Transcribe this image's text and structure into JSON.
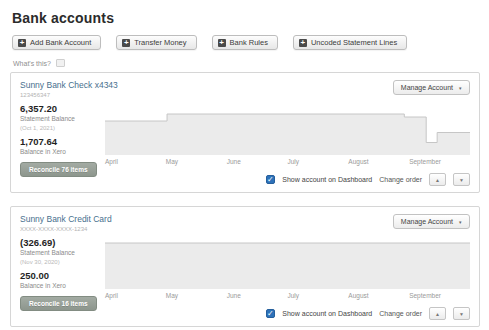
{
  "page": {
    "title": "Bank accounts",
    "whats_this_label": "What's this?"
  },
  "glyphs": {
    "plus": "+",
    "caret_down": "▾",
    "check": "✓",
    "up": "▲",
    "down": "▼"
  },
  "toolbar": {
    "buttons": [
      {
        "label": "Add Bank Account"
      },
      {
        "label": "Transfer Money"
      },
      {
        "label": "Bank Rules"
      },
      {
        "label": "Uncoded Statement Lines"
      }
    ]
  },
  "footer_controls": {
    "show_on_dashboard_label": "Show account on Dashboard",
    "change_order_label": "Change order"
  },
  "accounts": [
    {
      "name": "Sunny Bank Check x4343",
      "number": "123456347",
      "statement_balance": "6,357.20",
      "statement_balance_label": "Statement Balance",
      "statement_date": "(Oct 1, 2021)",
      "xero_balance": "1,707.64",
      "xero_balance_label": "Balance in Xero",
      "reconcile_label": "Reconcile 76 items",
      "manage_label": "Manage Account",
      "months": [
        "April",
        "May",
        "June",
        "July",
        "August",
        "September"
      ],
      "show_on_dashboard_checked": true,
      "chart": {
        "type": "area",
        "points": [
          [
            0,
            32
          ],
          [
            17,
            32
          ],
          [
            17,
            18
          ],
          [
            82,
            18
          ],
          [
            82,
            24
          ],
          [
            88,
            24
          ],
          [
            88,
            75
          ],
          [
            91,
            75
          ],
          [
            91,
            55
          ],
          [
            100,
            55
          ]
        ]
      }
    },
    {
      "name": "Sunny Bank Credit Card",
      "number": "XXXX-XXXX-XXXX-1234",
      "statement_balance": "(326.69)",
      "statement_balance_label": "Statement Balance",
      "statement_date": "(Nov 30, 2020)",
      "xero_balance": "250.00",
      "xero_balance_label": "Balance in Xero",
      "reconcile_label": "Reconcile 16 items",
      "manage_label": "Manage Account",
      "months": [
        "April",
        "May",
        "June",
        "July",
        "August",
        "September"
      ],
      "show_on_dashboard_checked": true,
      "chart": {
        "type": "area",
        "points": [
          [
            0,
            8
          ],
          [
            100,
            8
          ]
        ]
      }
    }
  ],
  "colors": {
    "accent_blue": "#2d72b9",
    "account_link": "#47708e",
    "reconcile_button": "#8d968d",
    "chart_fill": "#ebebeb",
    "chart_line": "#c6c6c6",
    "panel_border": "#d6d6d6"
  }
}
